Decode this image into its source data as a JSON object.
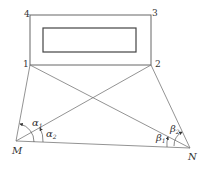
{
  "diagram": {
    "type": "surveying-intersection-figure",
    "points": {
      "p1": {
        "label": "1",
        "x": 30,
        "y": 65
      },
      "p2": {
        "label": "2",
        "x": 151,
        "y": 65
      },
      "p3": {
        "label": "3",
        "x": 150,
        "y": 15
      },
      "p4": {
        "label": "4",
        "x": 30,
        "y": 15
      },
      "M": {
        "label": "M",
        "x": 16,
        "y": 141
      },
      "N": {
        "label": "N",
        "x": 190,
        "y": 148
      }
    },
    "angles": {
      "alpha1": {
        "symbol": "α",
        "sub": "1"
      },
      "alpha2": {
        "symbol": "α",
        "sub": "2"
      },
      "beta1": {
        "symbol": "β",
        "sub": "1"
      },
      "beta2": {
        "symbol": "β",
        "sub": "2"
      }
    },
    "line_color": "#555555"
  }
}
